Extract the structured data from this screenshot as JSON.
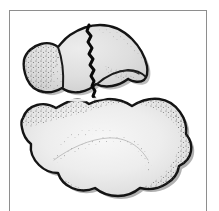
{
  "figure": {
    "caption": "",
    "domain_description": "Line drawing of two irregular fossil bone fragments, upper fragment with a jagged vertical crack, lower fragment a large wavy blob, both stippled along the inner margins",
    "frame": {
      "border_color": "#8e8e8e",
      "background_color": "#ffffff",
      "left": 9,
      "top": 10,
      "width": 198,
      "height": 212
    },
    "colors": {
      "outline": "#141414",
      "fill_upper": "#dedede",
      "fill_lower": "#e9e9e9",
      "fill_highlight": "#f6f6f6",
      "stipple": "#5a5a5a",
      "shadow": "#9a9a9a",
      "crack": "#0a0a0a",
      "page_background": "#ffffff"
    },
    "parts": [
      {
        "id": "upper-fragment",
        "label": "Upper fragment",
        "description": "Dome-shaped bone fragment with a jagged vertical fracture line and two internal ridge contours",
        "has_crack": true
      },
      {
        "id": "lower-fragment",
        "label": "Lower fragment",
        "description": "Large irregular fragment with wavy margins and interior stippled contour line",
        "has_crack": false
      }
    ],
    "annotations": {
      "crack_label": "fracture line",
      "gap_label": "separation gap"
    }
  }
}
